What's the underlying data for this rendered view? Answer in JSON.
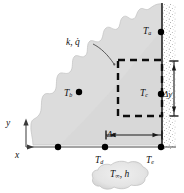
{
  "figure": {
    "type": "finite-difference-nodal-network",
    "background_color": "#ffffff",
    "solid_fill_color": "#dcdcdc",
    "solid_edge_color": "#b4b4b4",
    "line_color": "#1a1a1a",
    "node_color": "#000000",
    "control_volume_style": "dashed",
    "surface_texture": "stippled"
  },
  "labels": {
    "material": {
      "base": "k",
      "sep": ", ",
      "gen": "q̇"
    },
    "node_a": {
      "base": "T",
      "sub": "a"
    },
    "node_b": {
      "base": "T",
      "sub": "b"
    },
    "node_c": {
      "base": "T",
      "sub": "c"
    },
    "node_d": {
      "base": "T",
      "sub": "d"
    },
    "node_e": {
      "base": "T",
      "sub": "e"
    },
    "delta_y": "Δy",
    "delta_x": "Δx",
    "axis_x": "x",
    "axis_y": "y",
    "fluid": {
      "base": "T",
      "sub": "∞",
      "sep": ", ",
      "coef": "h"
    }
  },
  "geometry": {
    "axis_origin": {
      "x": 26,
      "y": 147
    },
    "x_axis_end": {
      "x": 176,
      "y": 147
    },
    "y_axis_top": {
      "x": 26,
      "y": 118
    },
    "right_wall_x": 162,
    "bottom_wall_y": 147,
    "control_volume": {
      "x": 118,
      "y": 60,
      "width": 44,
      "height": 56
    },
    "delta_x_span": {
      "from": 106,
      "to": 162,
      "y": 135
    },
    "delta_y_span": {
      "from": 61,
      "to": 116,
      "x": 174
    }
  },
  "nodes": [
    {
      "name": "node-a",
      "x": 161,
      "y": 32,
      "labeled": true
    },
    {
      "name": "node-b",
      "x": 79,
      "y": 92,
      "labeled": true
    },
    {
      "name": "node-c",
      "x": 161,
      "y": 94,
      "labeled": true
    },
    {
      "name": "node-d",
      "x": 105,
      "y": 147,
      "labeled": true
    },
    {
      "name": "node-e",
      "x": 161,
      "y": 147,
      "labeled": true
    },
    {
      "name": "node-unlabeled-bottom",
      "x": 58,
      "y": 147,
      "labeled": false
    }
  ]
}
